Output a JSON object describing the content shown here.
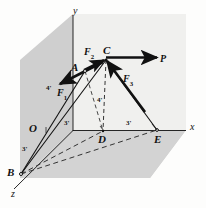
{
  "figure": {
    "colors": {
      "wall_back": "#cfcfcf",
      "wall_side": "#d8d8d8",
      "floor": "#d2d2d2",
      "page": "#fdfdfc",
      "ink": "#111111",
      "dashed": "#3a3a3a"
    }
  },
  "axes": {
    "y": {
      "label": "y",
      "x": 73,
      "y": 8
    },
    "x": {
      "label": "x",
      "x": 190,
      "y": 124
    },
    "z": {
      "label": "z",
      "x": 11,
      "y": 190
    }
  },
  "points": [
    {
      "name": "O",
      "label": "O",
      "px": 40,
      "py": 130,
      "lx": 29,
      "ly": 124
    },
    {
      "name": "A",
      "label": "A",
      "px": 85,
      "py": 71,
      "lx": 72,
      "ly": 64
    },
    {
      "name": "C",
      "label": "C",
      "px": 106,
      "py": 60,
      "lx": 104,
      "ly": 48
    },
    {
      "name": "D",
      "label": "D",
      "px": 103,
      "py": 131,
      "lx": 98,
      "ly": 136
    },
    {
      "name": "E",
      "label": "E",
      "px": 157,
      "py": 130,
      "lx": 155,
      "ly": 136
    },
    {
      "name": "B",
      "label": "B",
      "px": 21,
      "py": 174,
      "lx": 8,
      "ly": 170
    }
  ],
  "forces": [
    {
      "name": "F1",
      "base": "F",
      "sub": "1",
      "lx": 58,
      "ly": 90
    },
    {
      "name": "F2",
      "base": "F",
      "sub": "2",
      "lx": 86,
      "ly": 49
    },
    {
      "name": "F3",
      "base": "F",
      "sub": "3",
      "lx": 124,
      "ly": 76
    },
    {
      "name": "P",
      "base": "P",
      "sub": "",
      "lx": 161,
      "ly": 56
    }
  ],
  "dimensions": [
    {
      "name": "OD",
      "label": "3'",
      "lx": 66,
      "ly": 122
    },
    {
      "name": "DE",
      "label": "3'",
      "lx": 128,
      "ly": 122
    },
    {
      "name": "OB",
      "label": "3'",
      "lx": 23,
      "ly": 148
    },
    {
      "name": "AO",
      "label": "4'",
      "lx": 48,
      "ly": 87
    },
    {
      "name": "CD",
      "label": "4'",
      "lx": 98,
      "ly": 99
    }
  ]
}
